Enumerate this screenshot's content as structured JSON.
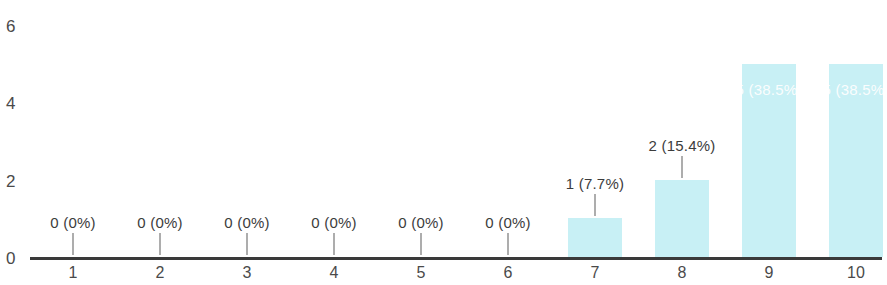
{
  "chart_data": {
    "type": "bar",
    "title": "",
    "subtitle": "",
    "xlabel": "",
    "ylabel": "",
    "categories": [
      "1",
      "2",
      "3",
      "4",
      "5",
      "6",
      "7",
      "8",
      "9",
      "10"
    ],
    "values": [
      0,
      0,
      0,
      0,
      0,
      0,
      1,
      2,
      5,
      5
    ],
    "data_labels": [
      "0 (0%)",
      "0 (0%)",
      "0 (0%)",
      "0 (0%)",
      "0 (0%)",
      "0 (0%)",
      "1 (7.7%)",
      "2 (15.4%)",
      "5 (38.5%)",
      "5 (38.5%)"
    ],
    "percentages": [
      "0%",
      "0%",
      "0%",
      "0%",
      "0%",
      "0%",
      "7.7%",
      "15.4%",
      "38.5%",
      "38.5%"
    ],
    "label_placement": [
      "above",
      "above",
      "above",
      "above",
      "above",
      "above",
      "above",
      "above",
      "inside",
      "inside"
    ],
    "ylim": [
      0,
      6.3
    ],
    "y_ticks": [
      "0",
      "2",
      "4",
      "6"
    ],
    "y_tick_values": [
      0,
      2,
      4,
      6
    ],
    "grid": false,
    "legend": false,
    "legend_position": "none",
    "bar_color": "#c8f0f5",
    "axis_color": "#3a3a3a",
    "label_color": "#3c3c3c",
    "inside_label_color": "#ffffff",
    "background_color": "#ffffff",
    "total_responses": 13
  }
}
